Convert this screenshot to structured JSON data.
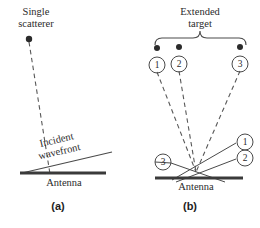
{
  "figure": {
    "panel_a": {
      "caption": "(a)",
      "caption_x": 58,
      "caption_y": 206,
      "scatterer_label_line1": "Single",
      "scatterer_label_line2": "scatterer",
      "scatterer_label_x": 36,
      "scatterer_label_y": 8,
      "scatterer_dot": {
        "x": 29,
        "y": 39,
        "r": 3.2
      },
      "ray": {
        "x1": 29,
        "y1": 42,
        "x2": 50,
        "y2": 174
      },
      "wavefront_label_line1": "Incident",
      "wavefront_label_line2": "wavefront",
      "wavefront_label_x": 60,
      "wavefront_label_y": 152,
      "wavefront_label_rotation": -13,
      "wavefront_line": {
        "x1": 22,
        "y1": 173,
        "x2": 112,
        "y2": 152
      },
      "antenna_label": "Antenna",
      "antenna_label_x": 64,
      "antenna_label_y": 179,
      "antenna_bar": {
        "x": 20,
        "y": 172,
        "width": 86,
        "height": 3
      }
    },
    "panel_b": {
      "caption": "(b)",
      "caption_x": 190,
      "caption_y": 206,
      "target_label_line1": "Extended",
      "target_label_line2": "target",
      "target_label_x": 200,
      "target_label_y": 8,
      "brace": {
        "left": 155,
        "right": 246,
        "y": 38,
        "mid": 200,
        "depth": 7
      },
      "scatterers": [
        {
          "id": "1",
          "dot_x": 157,
          "dot_y": 48,
          "circle_x": 157,
          "circle_y": 65
        },
        {
          "id": "2",
          "dot_x": 179,
          "dot_y": 47,
          "circle_x": 179,
          "circle_y": 64
        },
        {
          "id": "3",
          "dot_x": 240,
          "dot_y": 47,
          "circle_x": 240,
          "circle_y": 64
        }
      ],
      "convergence": {
        "x": 196,
        "y": 172
      },
      "rays": [
        {
          "x1": 157,
          "y1": 72,
          "x2": 196,
          "y2": 172
        },
        {
          "x1": 179,
          "y1": 71,
          "x2": 196,
          "y2": 172
        },
        {
          "x1": 240,
          "y1": 71,
          "x2": 196,
          "y2": 172
        }
      ],
      "wavefronts": [
        {
          "x1": 172,
          "y1": 180,
          "x2": 243,
          "y2": 143,
          "label": "1"
        },
        {
          "x1": 176,
          "y1": 182,
          "x2": 243,
          "y2": 159,
          "label": "2"
        },
        {
          "x1": 171,
          "y1": 163,
          "x2": 225,
          "y2": 182,
          "label": "3"
        }
      ],
      "wavefront_labels": [
        {
          "id": "1",
          "x": 245,
          "y": 142
        },
        {
          "id": "2",
          "x": 245,
          "y": 158
        },
        {
          "id": "3",
          "x": 163,
          "y": 162
        }
      ],
      "antenna_label": "Antenna",
      "antenna_label_x": 196,
      "antenna_label_y": 183,
      "antenna_bar": {
        "x": 155,
        "y": 177,
        "width": 88,
        "height": 3
      }
    },
    "colors": {
      "ink": "#2b2b2b",
      "solid_line": "#4a4a4a",
      "dashed_line": "#585858",
      "antenna": "#3a3a3a"
    }
  }
}
